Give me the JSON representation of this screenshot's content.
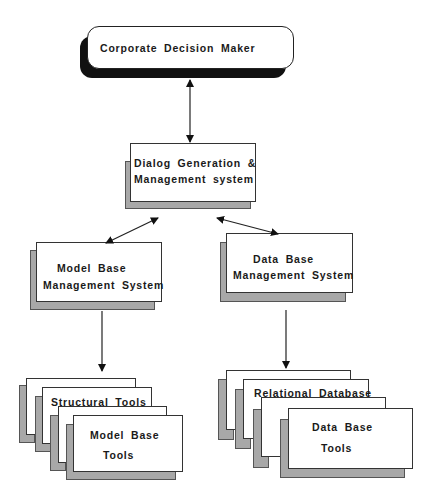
{
  "diagram": {
    "title_fragment": "",
    "nodes": {
      "corporate": {
        "label": "Corporate Decision Maker"
      },
      "dialog": {
        "line1": "Dialog Generation &",
        "line2": "Management system"
      },
      "mbms": {
        "line1": "Model Base",
        "line2": "Management System"
      },
      "dbms": {
        "line1": "Data Base",
        "line2": "Management System"
      },
      "model_tools": {
        "back_label": "Structural Tools",
        "front_line1": "Model Base",
        "front_line2": "Tools"
      },
      "db_tools": {
        "back_label": "Relational Database",
        "front_line1": "Data Base",
        "front_line2": "Tools"
      }
    },
    "edges": [
      {
        "from": "dialog",
        "to": "corporate",
        "type": "bidirectional"
      },
      {
        "from": "dialog",
        "to": "mbms",
        "type": "bidirectional"
      },
      {
        "from": "dialog",
        "to": "dbms",
        "type": "bidirectional"
      },
      {
        "from": "mbms",
        "to": "model_tools",
        "type": "directed"
      },
      {
        "from": "dbms",
        "to": "db_tools",
        "type": "directed"
      }
    ]
  }
}
